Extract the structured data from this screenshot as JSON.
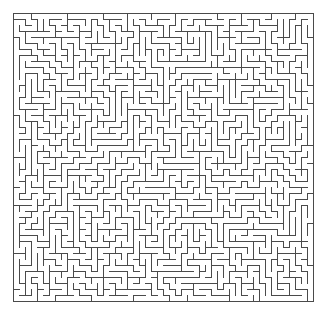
{
  "image": {
    "kind": "maze-puzzle",
    "width": 327,
    "height": 316,
    "background_color": "#ffffff",
    "title": ""
  },
  "maze": {
    "name": "rectangular-perfect-maze",
    "columns": 50,
    "rows": 48,
    "cell_size": 6,
    "origin_x": 13,
    "origin_y": 13,
    "grid_width": 300,
    "grid_height": 288,
    "wall_color": "#4a4a4a",
    "wall_thickness": 1,
    "border": "closed",
    "entrance": "none-visible",
    "exit": "none-visible",
    "algorithm": "depth-first-search-backtracker",
    "seed": 20240517,
    "passage_color": "#ffffff"
  },
  "labels": {
    "alt_text": "Dense black-and-white rectangular maze drawn with thin grey lines on a white background"
  }
}
